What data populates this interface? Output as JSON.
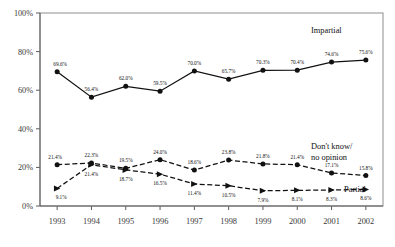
{
  "chart_data": {
    "type": "line",
    "title": "",
    "subtitle": "",
    "xlabel": "",
    "ylabel": "",
    "categories": [
      "1993",
      "1994",
      "1995",
      "1996",
      "1997",
      "1998",
      "1999",
      "2000",
      "2001",
      "2002"
    ],
    "ylim": [
      0,
      100
    ],
    "yticks": [
      0,
      20,
      40,
      60,
      80,
      100
    ],
    "ytick_labels": [
      "0%",
      "20%",
      "40%",
      "60%",
      "80%",
      "100%"
    ],
    "grid": false,
    "legend_position": "inline-right-of-series",
    "series": [
      {
        "name": "Impartial",
        "style": "solid",
        "marker": "filled-circle",
        "values": [
          69.6,
          56.4,
          62.0,
          59.5,
          70.0,
          65.7,
          70.3,
          70.4,
          74.6,
          75.6
        ],
        "labels": [
          "69.6%",
          "56.4%",
          "62.0%",
          "59.5%",
          "70.0%",
          "65.7%",
          "70.3%",
          "70.4%",
          "74.6%",
          "75.6%"
        ]
      },
      {
        "name": "Don't know/ no opinion",
        "style": "dashed",
        "marker": "filled-circle",
        "values": [
          21.4,
          22.3,
          19.5,
          24.0,
          18.6,
          23.8,
          21.8,
          21.4,
          17.1,
          15.8
        ],
        "labels": [
          "21.4%",
          "22.3%",
          "19.5%",
          "24.0%",
          "18.6%",
          "23.8%",
          "21.8%",
          "21.4%",
          "17.1%",
          "15.8%"
        ]
      },
      {
        "name": "Partial",
        "style": "dashed",
        "marker": "triangle",
        "values": [
          9.1,
          21.4,
          18.7,
          16.5,
          11.4,
          10.5,
          7.9,
          8.1,
          8.3,
          8.6
        ],
        "labels": [
          "9.1%",
          "21.4%",
          "18.7%",
          "16.5%",
          "11.4%",
          "10.5%",
          "7.9%",
          "8.1%",
          "8.3%",
          "8.6%"
        ]
      }
    ],
    "series_labels": {
      "impartial": "Impartial",
      "dontknow_line1": "Don't know/",
      "dontknow_line2": "no opinion",
      "partial": "Partial"
    },
    "colors": {
      "line": "#111111",
      "frame": "#8d8d8d",
      "axis": "#5a5a5a",
      "text": "#1a1a1a",
      "background": "#ffffff"
    }
  }
}
